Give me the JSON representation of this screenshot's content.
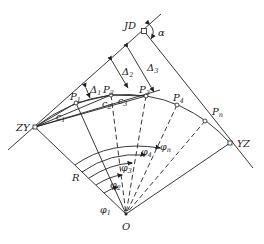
{
  "labels": {
    "jd": "JD",
    "alpha": "α",
    "zy": "ZY",
    "yz": "YZ",
    "o": "O",
    "r": "R",
    "p1": "P",
    "p1_sub": "1",
    "p2": "P",
    "p2_sub": "2",
    "p3": "P",
    "p3_sub": "3",
    "p4": "P",
    "p4_sub": "4",
    "pn": "P",
    "pn_sub": "n",
    "d1": "Δ",
    "d1_sub": "1",
    "d2": "Δ",
    "d2_sub": "2",
    "d3": "Δ",
    "d3_sub": "3",
    "c1": "c",
    "c1_sub": "1",
    "c2": "c",
    "c2_sub": "2",
    "c3": "c",
    "c3_sub": "3",
    "phi1": "φ",
    "phi1_sub": "1",
    "phi2": "φ",
    "phi2_sub": "2",
    "phi3": "φ",
    "phi3_sub": "3",
    "phi4": "φ",
    "phi4_sub": "4",
    "phin": "φ",
    "phin_sub": "n"
  },
  "colors": {
    "line": "#222222",
    "background": "#ffffff"
  }
}
